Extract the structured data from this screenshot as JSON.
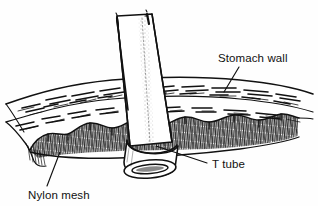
{
  "figure": {
    "background_color": "#fefefe",
    "ink_color": "#111111",
    "width": 318,
    "height": 206
  },
  "labels": {
    "stomach_wall": "Stomach wall",
    "t_tube": "T tube",
    "nylon_mesh": "Nylon mesh"
  },
  "structures": {
    "tube_name": "t-tube",
    "wall_name": "stomach-wall",
    "mesh_name": "nylon-mesh"
  }
}
